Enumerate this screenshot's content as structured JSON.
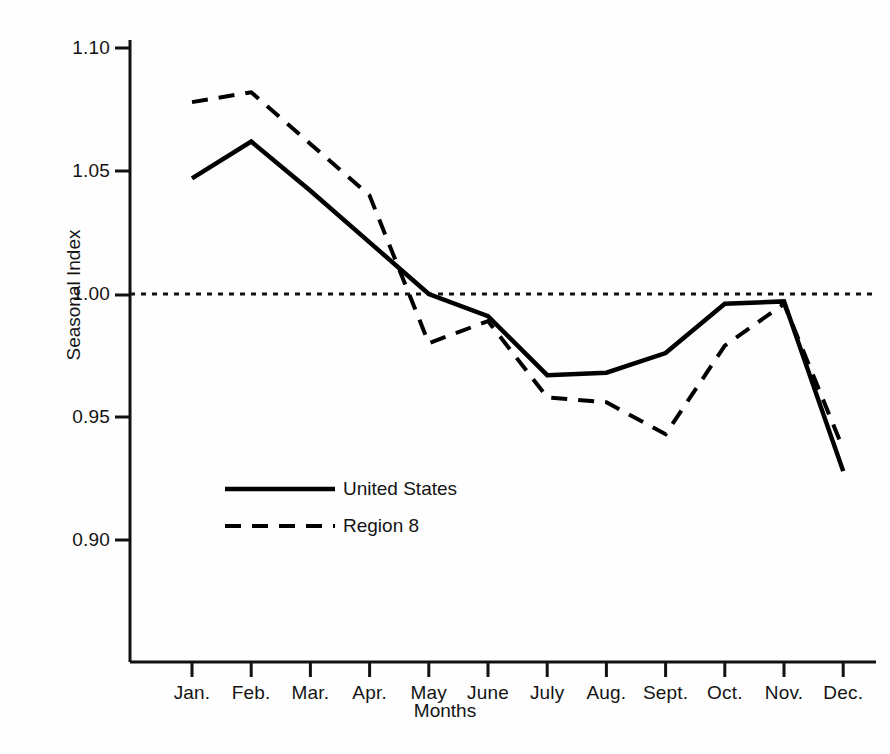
{
  "chart_data": {
    "type": "line",
    "title": "",
    "xlabel": "Months",
    "ylabel": "Seasonal Index",
    "categories": [
      "Jan.",
      "Feb.",
      "Mar.",
      "Apr.",
      "May",
      "June",
      "July",
      "Aug.",
      "Sept.",
      "Oct.",
      "Nov.",
      "Dec."
    ],
    "ylim": [
      0.9,
      1.1
    ],
    "yticks": [
      "1.10",
      "1.05",
      "1.00",
      "0.95",
      "0.90"
    ],
    "ytick_values": [
      1.1,
      1.05,
      1.0,
      0.95,
      0.9
    ],
    "grid": false,
    "legend_position": "inside-lower-left",
    "reference_line": {
      "value": 1.0,
      "style": "dotted",
      "label": ""
    },
    "series": [
      {
        "name": "United States",
        "style": "solid",
        "color": "#000000",
        "values": [
          1.047,
          1.062,
          1.042,
          1.021,
          1.0,
          0.991,
          0.967,
          0.968,
          0.976,
          0.996,
          0.997,
          0.928
        ]
      },
      {
        "name": "Region 8",
        "style": "dashed",
        "color": "#000000",
        "values": [
          1.078,
          1.082,
          1.061,
          1.04,
          0.98,
          0.989,
          0.958,
          0.956,
          0.943,
          0.979,
          0.996,
          0.937
        ]
      }
    ]
  },
  "legend": {
    "entries": [
      {
        "label": "United States",
        "style": "solid"
      },
      {
        "label": "Region 8",
        "style": "dashed"
      }
    ]
  }
}
